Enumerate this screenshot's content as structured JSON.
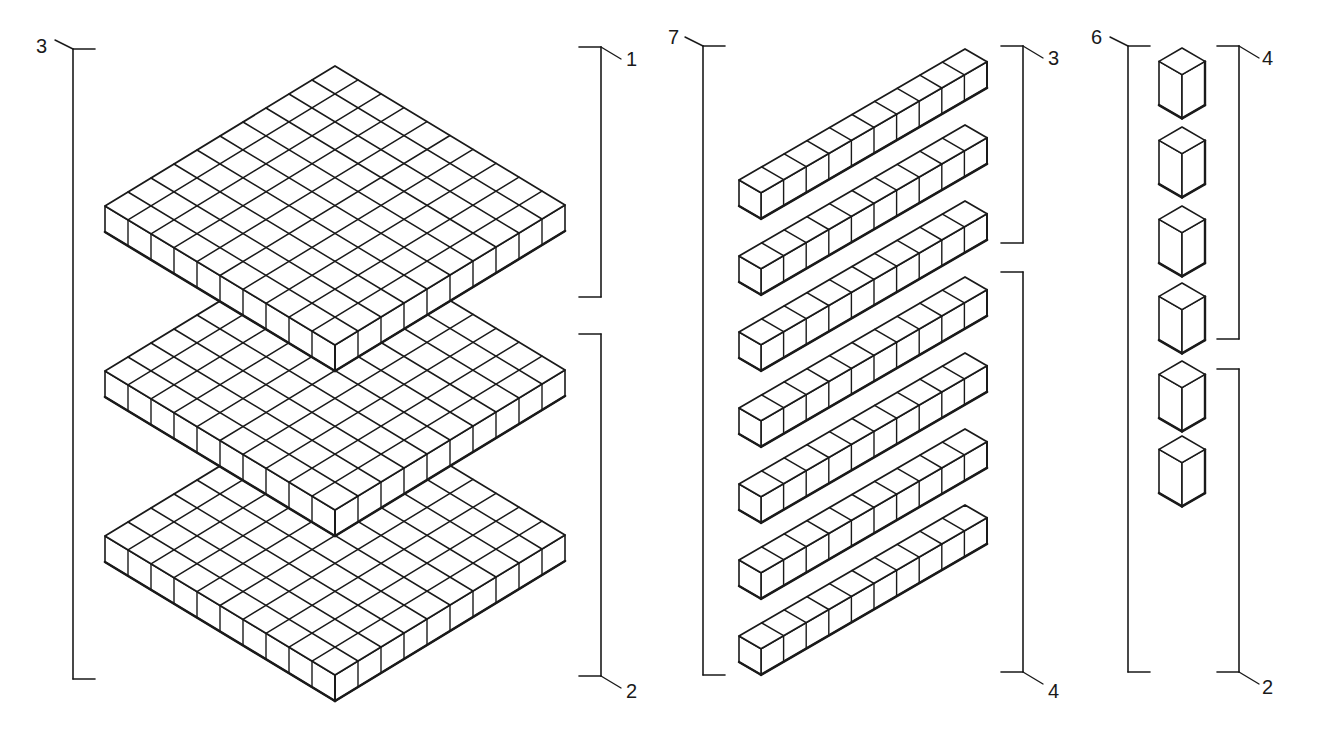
{
  "diagram": {
    "stroke_color": "#1a1a1a",
    "background": "#ffffff",
    "groups": [
      {
        "name": "hundreds",
        "block": "flat 10x10",
        "count": 3,
        "brackets": [
          {
            "label": "3",
            "side": "left",
            "span": "all three flats"
          },
          {
            "label": "1",
            "side": "right",
            "span": "top flat"
          },
          {
            "label": "2",
            "side": "right",
            "span": "lower two flats"
          }
        ]
      },
      {
        "name": "tens",
        "block": "rod 1x10",
        "count": 7,
        "brackets": [
          {
            "label": "7",
            "side": "left",
            "span": "all seven rods"
          },
          {
            "label": "3",
            "side": "right",
            "span": "top three rods"
          },
          {
            "label": "4",
            "side": "right",
            "span": "bottom four rods"
          }
        ]
      },
      {
        "name": "ones",
        "block": "unit cube",
        "count": 6,
        "brackets": [
          {
            "label": "6",
            "side": "left",
            "span": "all six cubes"
          },
          {
            "label": "4",
            "side": "right",
            "span": "top four cubes"
          },
          {
            "label": "2",
            "side": "right",
            "span": "bottom two cubes"
          }
        ]
      }
    ],
    "labels": {
      "hundreds_total": "3",
      "hundreds_top": "1",
      "hundreds_bottom": "2",
      "tens_total": "7",
      "tens_top": "3",
      "tens_bottom": "4",
      "ones_total": "6",
      "ones_top": "4",
      "ones_bottom": "2"
    }
  }
}
